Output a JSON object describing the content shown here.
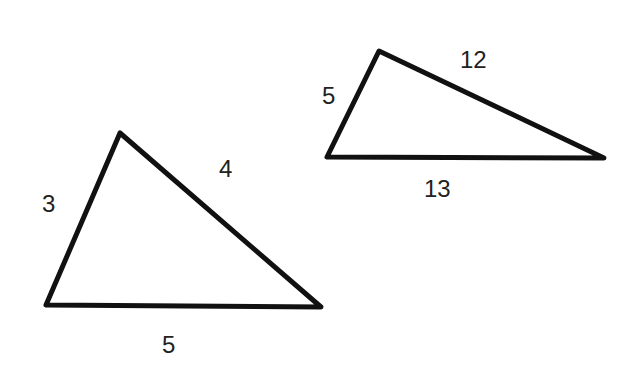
{
  "diagram": {
    "stroke_color": "#111111",
    "background": "#ffffff",
    "triangles": [
      {
        "name": "triangle-3-4-5",
        "vertices": [
          [
            120,
            133
          ],
          [
            46,
            305
          ],
          [
            321,
            307
          ]
        ],
        "labels": [
          {
            "text": "3",
            "x": 50,
            "y": 212
          },
          {
            "text": "4",
            "x": 227,
            "y": 177
          },
          {
            "text": "5",
            "x": 170,
            "y": 353
          }
        ]
      },
      {
        "name": "triangle-5-12-13",
        "vertices": [
          [
            379,
            51
          ],
          [
            327,
            157
          ],
          [
            604,
            158
          ]
        ],
        "labels": [
          {
            "text": "5",
            "x": 330,
            "y": 104
          },
          {
            "text": "12",
            "x": 475,
            "y": 68
          },
          {
            "text": "13",
            "x": 438,
            "y": 197
          }
        ]
      }
    ]
  }
}
